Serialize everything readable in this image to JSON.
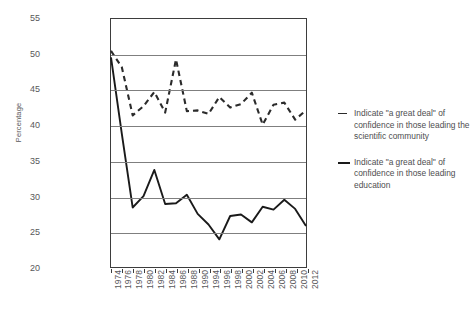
{
  "chart_data": {
    "type": "line",
    "title": "",
    "xlabel": "",
    "ylabel": "Percentage",
    "ylim": [
      20,
      55
    ],
    "ytick_values": [
      20,
      25,
      30,
      35,
      40,
      45,
      50,
      55
    ],
    "ytick_labels": [
      "20",
      "25",
      "30",
      "35",
      "40",
      "45",
      "50",
      "55"
    ],
    "grid": true,
    "legend_position": "right",
    "categories": [
      "1974",
      "1976",
      "1978",
      "1980",
      "1982",
      "1984",
      "1986",
      "1988",
      "1990",
      "1994",
      "1996",
      "1998",
      "2000",
      "2002",
      "2004",
      "2006",
      "2008",
      "2010",
      "2012"
    ],
    "x": [
      1974,
      1976,
      1978,
      1980,
      1982,
      1984,
      1986,
      1988,
      1990,
      1994,
      1996,
      1998,
      2000,
      2002,
      2004,
      2006,
      2008,
      2010,
      2012
    ],
    "series": [
      {
        "name": "Indicate \"a great deal\" of confidence in those leading the scientific community",
        "style": "dashed",
        "color": "#2b2b2b",
        "values": [
          50.5,
          48.2,
          41.4,
          42.7,
          44.7,
          41.8,
          49.3,
          42.0,
          42.1,
          41.6,
          44.0,
          42.5,
          43.0,
          44.6,
          40.1,
          42.9,
          43.2,
          40.8,
          42.1
        ]
      },
      {
        "name": "Indicate \"a great deal\" of confidence in those leading education",
        "style": "solid",
        "color": "#1a1a1a",
        "values": [
          49.6,
          38.8,
          28.4,
          30.0,
          33.7,
          28.9,
          29.0,
          30.2,
          27.5,
          26.0,
          23.9,
          27.2,
          27.4,
          26.3,
          28.5,
          28.1,
          29.5,
          28.2,
          25.8
        ]
      }
    ]
  },
  "legend": {
    "entries": [
      {
        "label": "Indicate \"a great deal\" of confidence in those leading the scientific community",
        "marker": "dashed-line-marker"
      },
      {
        "label": "Indicate \"a great deal\" of confidence in those leading education",
        "marker": "solid-line-marker"
      }
    ]
  }
}
